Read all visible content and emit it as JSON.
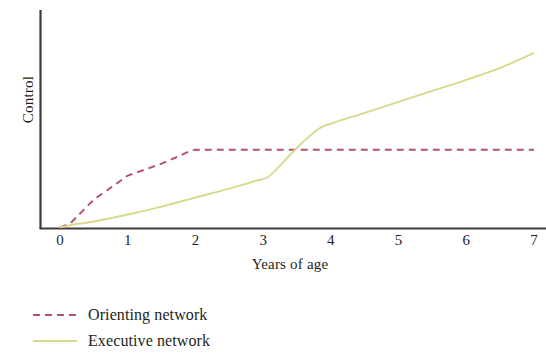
{
  "chart_data": {
    "type": "line",
    "title": "",
    "subtitle": "",
    "xlabel": "Years of age",
    "ylabel": "Control",
    "xlim": [
      0,
      7
    ],
    "ylim": [
      0,
      1
    ],
    "grid": false,
    "legend_position": "bottom-left",
    "x_ticks": [
      "0",
      "1",
      "2",
      "3",
      "4",
      "5",
      "6",
      "7"
    ],
    "x_tick_values": [
      0,
      1,
      2,
      3,
      4,
      5,
      6,
      7
    ],
    "y_ticks": [],
    "axis_style": "left-and-bottom-spines-only",
    "series": [
      {
        "name": "Orienting network",
        "color": "#b8506b",
        "style": "dashed",
        "x": [
          0,
          0.15,
          0.5,
          1,
          1.5,
          1.9,
          2.0,
          2.5,
          3,
          3.5,
          4,
          4.5,
          5,
          5.5,
          6,
          6.5,
          7
        ],
        "values": [
          0.0,
          0.02,
          0.14,
          0.26,
          0.32,
          0.38,
          0.39,
          0.39,
          0.39,
          0.39,
          0.39,
          0.39,
          0.39,
          0.39,
          0.39,
          0.39,
          0.39
        ]
      },
      {
        "name": "Executive network",
        "color": "#d9d98d",
        "style": "solid",
        "x": [
          0,
          0.2,
          0.5,
          1,
          1.5,
          2,
          2.5,
          2.9,
          3.1,
          3.5,
          3.8,
          4.0,
          4.5,
          5,
          5.5,
          6,
          6.5,
          7
        ],
        "values": [
          0.0,
          0.015,
          0.03,
          0.065,
          0.105,
          0.15,
          0.195,
          0.235,
          0.26,
          0.4,
          0.49,
          0.52,
          0.575,
          0.63,
          0.685,
          0.74,
          0.8,
          0.875
        ]
      }
    ],
    "annotations": [
      {
        "text": "Orienting network plateaus at age 2",
        "x": 2.0,
        "y": 0.39
      },
      {
        "text": "Executive network crosses orienting network near age 3.5",
        "x": 3.5,
        "y": 0.39
      }
    ]
  },
  "axes": {
    "y_title": "Control",
    "x_title": "Years of age",
    "tick_labels": [
      "0",
      "1",
      "2",
      "3",
      "4",
      "5",
      "6",
      "7"
    ]
  },
  "legend": {
    "items": [
      {
        "label": "Orienting network",
        "color": "#b8506b",
        "style": "dashed"
      },
      {
        "label": "Executive network",
        "color": "#d9d98d",
        "style": "solid"
      }
    ]
  },
  "colors": {
    "axis": "#3b3b3b",
    "text": "#231f20",
    "background": "#ffffff",
    "orienting": "#b8506b",
    "executive": "#d9d98d"
  }
}
